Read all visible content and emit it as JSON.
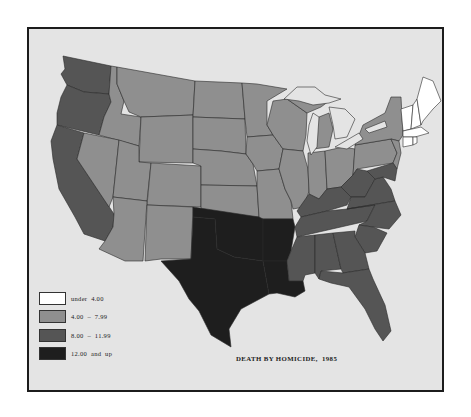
{
  "map": {
    "title": "DEATH BY HOMICIDE,  1985",
    "region": "Contiguous United States",
    "colors": {
      "under_4": "#ffffff",
      "4_to_7_99": "#8f8f8f",
      "8_to_11_99": "#555555",
      "12_and_up": "#1e1e1e",
      "background": "#e4e4e4",
      "border": "#1c1c1c"
    },
    "legend": [
      {
        "label": "under  4.00",
        "color": "#ffffff"
      },
      {
        "label": "4.00  –  7.99",
        "color": "#8f8f8f"
      },
      {
        "label": "8.00  –  11.99",
        "color": "#555555"
      },
      {
        "label": "12.00  and  up",
        "color": "#1e1e1e"
      }
    ],
    "states_by_class": {
      "under 4.00": [
        "Maine",
        "New Hampshire",
        "Vermont",
        "Massachusetts",
        "Connecticut",
        "Rhode Island"
      ],
      "4.00 - 7.99": [
        "Montana",
        "Idaho",
        "Wyoming",
        "Nevada",
        "Utah",
        "Colorado",
        "Arizona",
        "New Mexico",
        "North Dakota",
        "South Dakota",
        "Nebraska",
        "Kansas",
        "Minnesota",
        "Iowa",
        "Missouri",
        "Wisconsin",
        "Illinois",
        "Michigan",
        "Indiana",
        "Ohio",
        "Pennsylvania",
        "New York",
        "New Jersey"
      ],
      "8.00 - 11.99": [
        "Washington",
        "Oregon",
        "California",
        "Kentucky",
        "West Virginia",
        "Virginia",
        "Maryland",
        "Delaware",
        "Tennessee",
        "North Carolina",
        "South Carolina",
        "Mississippi",
        "Alabama",
        "Georgia",
        "Florida"
      ],
      "12.00 and up": [
        "Texas",
        "Oklahoma",
        "Arkansas",
        "Louisiana"
      ]
    }
  }
}
